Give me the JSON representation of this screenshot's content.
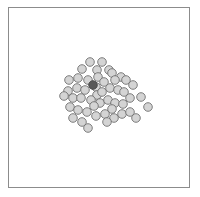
{
  "figure": {
    "title": "",
    "background_color": "#ffffff",
    "width": 200,
    "height": 197
  },
  "frame": {
    "name": "plot-border",
    "x": 8,
    "y": 7,
    "width": 182,
    "height": 181,
    "stroke_color": "#8c8c8c",
    "stroke_width": 1,
    "fill_color": "#ffffff"
  },
  "marker_style": {
    "normal_fill": "#d4d4d4",
    "normal_stroke": "#707070",
    "highlight_fill": "#595959",
    "highlight_stroke": "#4a4a4a",
    "stroke_width": 0.9,
    "radius": 4.3
  },
  "chart_data": {
    "type": "scatter",
    "title": "",
    "xlabel": "",
    "ylabel": "",
    "xlim": [
      8,
      190
    ],
    "ylim": [
      7,
      188
    ],
    "grid": false,
    "legend": false,
    "axis_ticks": false,
    "point_count": 51,
    "highlight_count": 1,
    "series": [
      {
        "name": "points",
        "color": "#d4d4d4",
        "points": [
          {
            "x": 90,
            "y": 62,
            "highlight": false
          },
          {
            "x": 102,
            "y": 62,
            "highlight": false
          },
          {
            "x": 82,
            "y": 69,
            "highlight": false
          },
          {
            "x": 97,
            "y": 70,
            "highlight": false
          },
          {
            "x": 98,
            "y": 77,
            "highlight": false
          },
          {
            "x": 109,
            "y": 70,
            "highlight": false
          },
          {
            "x": 112,
            "y": 73,
            "highlight": false
          },
          {
            "x": 121,
            "y": 77,
            "highlight": false
          },
          {
            "x": 69,
            "y": 80,
            "highlight": false
          },
          {
            "x": 78,
            "y": 78,
            "highlight": false
          },
          {
            "x": 88,
            "y": 80,
            "highlight": false
          },
          {
            "x": 104,
            "y": 82,
            "highlight": false
          },
          {
            "x": 115,
            "y": 80,
            "highlight": false
          },
          {
            "x": 126,
            "y": 80,
            "highlight": false
          },
          {
            "x": 133,
            "y": 85,
            "highlight": false
          },
          {
            "x": 96,
            "y": 87,
            "highlight": false
          },
          {
            "x": 97,
            "y": 95,
            "highlight": false
          },
          {
            "x": 102,
            "y": 92,
            "highlight": false
          },
          {
            "x": 110,
            "y": 88,
            "highlight": false
          },
          {
            "x": 118,
            "y": 90,
            "highlight": false
          },
          {
            "x": 124,
            "y": 92,
            "highlight": false
          },
          {
            "x": 68,
            "y": 91,
            "highlight": false
          },
          {
            "x": 77,
            "y": 88,
            "highlight": false
          },
          {
            "x": 85,
            "y": 90,
            "highlight": false
          },
          {
            "x": 64,
            "y": 96,
            "highlight": false
          },
          {
            "x": 73,
            "y": 98,
            "highlight": false
          },
          {
            "x": 81,
            "y": 98,
            "highlight": false
          },
          {
            "x": 91,
            "y": 100,
            "highlight": false
          },
          {
            "x": 100,
            "y": 103,
            "highlight": false
          },
          {
            "x": 94,
            "y": 106,
            "highlight": false
          },
          {
            "x": 108,
            "y": 100,
            "highlight": false
          },
          {
            "x": 115,
            "y": 103,
            "highlight": false
          },
          {
            "x": 112,
            "y": 109,
            "highlight": false
          },
          {
            "x": 123,
            "y": 104,
            "highlight": false
          },
          {
            "x": 130,
            "y": 98,
            "highlight": false
          },
          {
            "x": 141,
            "y": 97,
            "highlight": false
          },
          {
            "x": 148,
            "y": 107,
            "highlight": false
          },
          {
            "x": 70,
            "y": 107,
            "highlight": false
          },
          {
            "x": 78,
            "y": 110,
            "highlight": false
          },
          {
            "x": 87,
            "y": 112,
            "highlight": false
          },
          {
            "x": 96,
            "y": 116,
            "highlight": false
          },
          {
            "x": 105,
            "y": 114,
            "highlight": false
          },
          {
            "x": 114,
            "y": 118,
            "highlight": false
          },
          {
            "x": 122,
            "y": 114,
            "highlight": false
          },
          {
            "x": 130,
            "y": 112,
            "highlight": false
          },
          {
            "x": 136,
            "y": 118,
            "highlight": false
          },
          {
            "x": 73,
            "y": 118,
            "highlight": false
          },
          {
            "x": 82,
            "y": 122,
            "highlight": false
          },
          {
            "x": 88,
            "y": 128,
            "highlight": false
          },
          {
            "x": 107,
            "y": 122,
            "highlight": false
          },
          {
            "x": 93,
            "y": 85,
            "highlight": true
          }
        ]
      }
    ]
  }
}
